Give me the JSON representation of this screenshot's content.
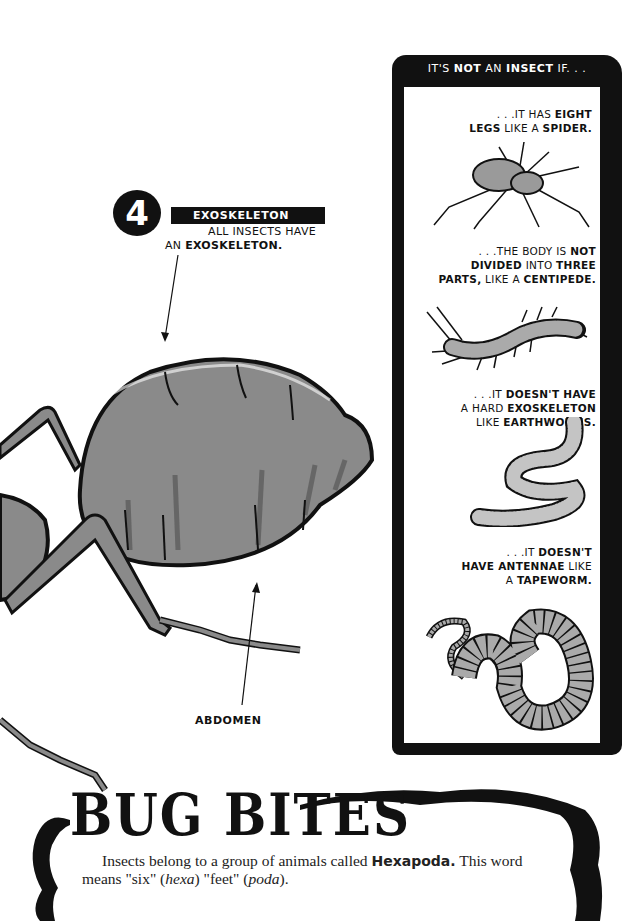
{
  "callout": {
    "number": "4",
    "title": "EXOSKELETON",
    "desc_line1": "ALL INSECTS HAVE",
    "desc_line2_prefix": "AN ",
    "desc_line2_bold": "EXOSKELETON."
  },
  "labels": {
    "abdomen": "ABDOMEN"
  },
  "panel": {
    "title_parts": [
      "IT'S ",
      "NOT",
      " AN ",
      "INSECT",
      " IF. . ."
    ],
    "items": [
      {
        "lines": [
          [
            {
              "t": ". . .IT HAS ",
              "b": false
            },
            {
              "t": "EIGHT",
              "b": true
            }
          ],
          [
            {
              "t": "LEGS",
              "b": true
            },
            {
              "t": " LIKE A ",
              "b": false
            },
            {
              "t": "SPIDER.",
              "b": true
            }
          ]
        ],
        "illustration": "spider-icon"
      },
      {
        "lines": [
          [
            {
              "t": ". . .THE BODY IS ",
              "b": false
            },
            {
              "t": "NOT",
              "b": true
            }
          ],
          [
            {
              "t": "DIVIDED",
              "b": true
            },
            {
              "t": " INTO ",
              "b": false
            },
            {
              "t": "THREE",
              "b": true
            }
          ],
          [
            {
              "t": "PARTS,",
              "b": true
            },
            {
              "t": " LIKE A ",
              "b": false
            },
            {
              "t": "CENTIPEDE.",
              "b": true
            }
          ]
        ],
        "illustration": "centipede-icon"
      },
      {
        "lines": [
          [
            {
              "t": ". . .IT ",
              "b": false
            },
            {
              "t": "DOESN'T HAVE",
              "b": true
            }
          ],
          [
            {
              "t": "A HARD ",
              "b": false
            },
            {
              "t": "EXOSKELETON",
              "b": true
            }
          ],
          [
            {
              "t": "LIKE ",
              "b": false
            },
            {
              "t": "EARTHWORMS.",
              "b": true
            }
          ]
        ],
        "illustration": "earthworm-icon"
      },
      {
        "lines": [
          [
            {
              "t": ". . .IT ",
              "b": false
            },
            {
              "t": "DOESN'T",
              "b": true
            }
          ],
          [
            {
              "t": "HAVE ANTENNAE",
              "b": true
            },
            {
              "t": " LIKE",
              "b": false
            }
          ],
          [
            {
              "t": "A ",
              "b": false
            },
            {
              "t": "TAPEWORM.",
              "b": true
            }
          ]
        ],
        "illustration": "tapeworm-icon"
      }
    ]
  },
  "bug_bites": {
    "title": "BUG BITES",
    "text_part1": "Insects belong to a group of animals called ",
    "text_bold": "Hexapoda.",
    "text_part2": " This word means \"six\" (",
    "text_italic1": "hexa",
    "text_part3": ") \"feet\" (",
    "text_italic2": "poda",
    "text_part4": ")."
  },
  "colors": {
    "ink": "#111111",
    "ant_gray": "#8a8a8a",
    "ant_dark": "#5e5e5e",
    "worm_gray": "#bdbdbd",
    "paper": "#ffffff"
  }
}
